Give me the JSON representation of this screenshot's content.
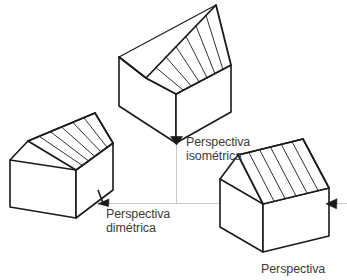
{
  "figure": {
    "kind": "technical-drawing",
    "background_color": "#ffffff",
    "line_color": "#1a1a1a",
    "guide_color": "#c9c9c9",
    "text_color": "#3b3b3b",
    "roof_fill": "#ffffff",
    "wall_fill": "#ffffff"
  },
  "labels": {
    "isometric": "Perspectiva\nisométrica",
    "isometric_line1": "Perspectiva",
    "isometric_line2": "isométrica",
    "dimetric": "Perspectiva\ndimétrica",
    "dimetric_line1": "Perspectiva",
    "dimetric_line2": "dimétrica",
    "cavalier": "Perspectiva",
    "cavalier_line1": "Perspectiva"
  },
  "houses": [
    {
      "id": "isometric-house",
      "projection": "isométrica",
      "roof_batten_count": 7,
      "position": "top-center"
    },
    {
      "id": "dimetric-house",
      "projection": "dimétrica",
      "roof_batten_count": 6,
      "position": "left"
    },
    {
      "id": "cavalier-house",
      "projection": "perspectiva",
      "roof_batten_count": 6,
      "position": "bottom-right"
    }
  ],
  "markers": [
    {
      "id": "arrow-isometric",
      "direction": "down",
      "points_to": "isometric-house"
    },
    {
      "id": "arrow-dimetric",
      "direction": "left",
      "points_to": "dimetric-house"
    },
    {
      "id": "arrow-cavalier",
      "direction": "left",
      "points_to": "cavalier-house"
    }
  ]
}
